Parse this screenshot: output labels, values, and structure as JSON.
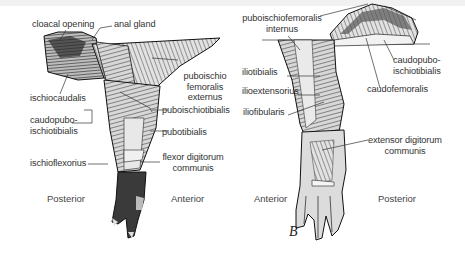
{
  "figure_letter": "B",
  "left_view": {
    "labels": {
      "cloacal_opening": "cloacal opening",
      "anal_gland": "anal gland",
      "puboischiofemoralis_externus_1": "puboischio",
      "puboischiofemoralis_externus_2": "femoralis",
      "puboischiofemoralis_externus_3": "externus",
      "ischiocaudalis": "ischiocaudalis",
      "puboischiotibialis": "puboischiotibialis",
      "caudopuboischiotibialis_1": "caudopubo-",
      "caudopuboischiotibialis_2": "ischiotibialis",
      "pubotibialis": "pubotibialis",
      "ischioflexorius": "ischioflexorius",
      "flexor_digitorum_communis_1": "flexor digitorum",
      "flexor_digitorum_communis_2": "communis"
    },
    "directions": {
      "left": "Posterior",
      "right": "Anterior"
    }
  },
  "right_view": {
    "labels": {
      "puboischiofemoralis_internus_1": "puboischiofemoralis",
      "puboischiofemoralis_internus_2": "internus",
      "iliotibialis": "iliotibialis",
      "ilioextensorius": "ilioextensorius",
      "iliofibularis": "iliofibularis",
      "caudopuboischiotibialis_1": "caudopubo-",
      "caudopuboischiotibialis_2": "ischiotibialis",
      "caudofemoralis": "caudofemoralis",
      "extensor_digitorum_communis_1": "extensor digitorum",
      "extensor_digitorum_communis_2": "communis"
    },
    "directions": {
      "left": "Anterior",
      "right": "Posterior"
    }
  }
}
